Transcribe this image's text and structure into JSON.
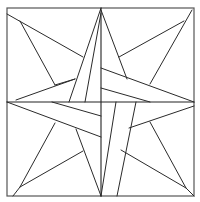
{
  "diagram": {
    "title": "",
    "type": "quilt-block-line-drawing",
    "stroke_color": "#2a2a2a",
    "background_color": "#ffffff",
    "frame": {
      "x1": 7,
      "y1": 8,
      "x2": 194,
      "y2": 196
    },
    "center": {
      "x": 101,
      "y": 102
    }
  }
}
